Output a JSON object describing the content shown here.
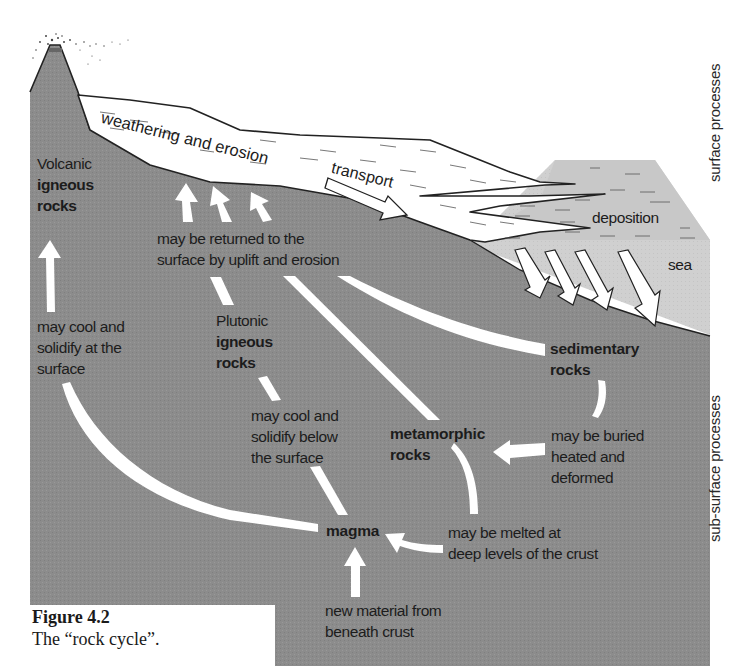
{
  "diagram": {
    "title": "Rock cycle",
    "colors": {
      "crust": "#8c8c8c",
      "sea": "#cfcfcf",
      "sediment_flow": "#ffffff",
      "arrow_fill": "#ffffff",
      "outline": "#222222",
      "text": "#1c1c1c"
    },
    "side_labels": {
      "surface": "surface processes",
      "subsurface": "sub-surface processes"
    },
    "surface_labels": {
      "weathering": "weathering and erosion",
      "transport": "transport",
      "deposition": "deposition",
      "sea": "sea"
    },
    "nodes": {
      "volcanic": {
        "line1": "Volcanic",
        "line2": "igneous",
        "line3": "rocks"
      },
      "plutonic": {
        "line1": "Plutonic",
        "line2": "igneous",
        "line3": "rocks"
      },
      "sedimentary": {
        "line1": "sedimentary",
        "line2": "rocks"
      },
      "metamorphic": {
        "line1": "metamorphic",
        "line2": "rocks"
      },
      "magma": {
        "line1": "magma"
      }
    },
    "processes": {
      "uplift": {
        "line1": "may be returned to the",
        "line2": "surface by uplift and erosion"
      },
      "cool_surface": {
        "line1": "may cool and",
        "line2": "solidify at the",
        "line3": "surface"
      },
      "cool_below": {
        "line1": "may cool and",
        "line2": "solidify below",
        "line3": "the surface"
      },
      "buried": {
        "line1": "may be buried",
        "line2": "heated and",
        "line3": "deformed"
      },
      "melted": {
        "line1": "may be melted at",
        "line2": "deep levels of the crust"
      },
      "new_material": {
        "line1": "new material from",
        "line2": "beneath crust"
      }
    }
  },
  "caption": {
    "figure_number": "Figure 4.2",
    "text": "The “rock cycle”."
  }
}
